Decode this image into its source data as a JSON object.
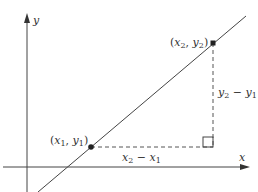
{
  "diagram": {
    "type": "slope-of-line",
    "colors": {
      "axis": "#444444",
      "line": "#444444",
      "dashed": "#555555",
      "point": "#222222",
      "text": "#333333",
      "background": "#ffffff"
    },
    "axes": {
      "x_label": "x",
      "y_label": "y"
    },
    "points": [
      {
        "name": "x1y1",
        "label_open": "(",
        "x_var": "x",
        "x_sub": "1",
        "sep": ", ",
        "y_var": "y",
        "y_sub": "1",
        "label_close": ")"
      },
      {
        "name": "x2y2",
        "label_open": "(",
        "x_var": "x",
        "x_sub": "2",
        "sep": ", ",
        "y_var": "y",
        "y_sub": "2",
        "label_close": ")"
      }
    ],
    "run_label": {
      "a_var": "x",
      "a_sub": "2",
      "op": " − ",
      "b_var": "x",
      "b_sub": "1"
    },
    "rise_label": {
      "a_var": "y",
      "a_sub": "2",
      "op": " − ",
      "b_var": "y",
      "b_sub": "1"
    }
  }
}
